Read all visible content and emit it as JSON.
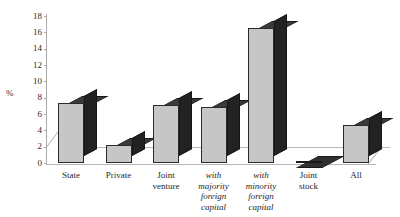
{
  "chart_data": {
    "type": "bar",
    "title": "",
    "subtitle": "",
    "xlabel": "",
    "ylabel": "%",
    "ylim": [
      0,
      18
    ],
    "ytick_step": 2,
    "yticks": [
      18,
      16,
      14,
      12,
      10,
      8,
      6,
      4,
      2,
      0
    ],
    "grid": false,
    "legend": null,
    "style": "3d-bar",
    "categories": [
      "State",
      "Private",
      "Joint venture",
      "with majority foreign capital",
      "with minority foreign capital",
      "Joint stock",
      "All"
    ],
    "values": [
      7.3,
      2.2,
      7.1,
      6.9,
      16.5,
      0.1,
      4.6
    ],
    "series": [
      {
        "name": "",
        "values": [
          7.3,
          2.2,
          7.1,
          6.9,
          16.5,
          0.1,
          4.6
        ]
      }
    ]
  },
  "axis": {
    "y_label": "%",
    "ticks": [
      "18",
      "16",
      "14",
      "12",
      "10",
      "8",
      "6",
      "4",
      "2",
      "0"
    ]
  },
  "categories": [
    {
      "lines": [
        "State"
      ],
      "italic": false
    },
    {
      "lines": [
        "Private"
      ],
      "italic": false
    },
    {
      "lines": [
        "Joint",
        "venture"
      ],
      "italic": false
    },
    {
      "lines": [
        "with",
        "majority",
        "foreign",
        "capital"
      ],
      "italic": true
    },
    {
      "lines": [
        "with",
        "minority",
        "foreign",
        "capital"
      ],
      "italic": true
    },
    {
      "lines": [
        "Joint",
        "stock"
      ],
      "italic": false
    },
    {
      "lines": [
        "All"
      ],
      "italic": false
    }
  ],
  "colors": {
    "bar_front": "#c6c6c6",
    "bar_side": "#222222",
    "bar_top": "#3a3a3a",
    "axis": "#a9a9a9",
    "text": "#1f1f1f",
    "background": "#ffffff"
  }
}
